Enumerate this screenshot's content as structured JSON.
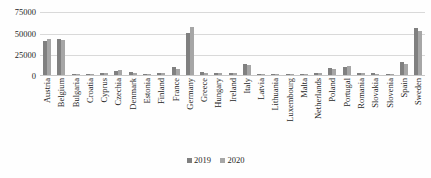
{
  "chart_data": {
    "type": "bar",
    "title": "",
    "subtitle": "",
    "xlabel": "",
    "ylabel": "",
    "ylim": [
      0,
      80000
    ],
    "yticks": [
      0,
      25000,
      50000,
      75000
    ],
    "ytick_labels": [
      "0",
      "25000",
      "50000",
      "75000"
    ],
    "grid": true,
    "legend_position": "bottom-center",
    "categories": [
      "Austria",
      "Belgium",
      "Bulgaria",
      "Croatia",
      "Cyprus",
      "Czechia",
      "Denmark",
      "Estonia",
      "Finland",
      "France",
      "Germany",
      "Greece",
      "Hungary",
      "Ireland",
      "Italy",
      "Latvia",
      "Lithuania",
      "Luxembourg",
      "Malta",
      "Netherlands",
      "Poland",
      "Portugal",
      "Romania",
      "Slovakia",
      "Slovenia",
      "Spain",
      "Sweden"
    ],
    "series": [
      {
        "name": "2019",
        "color": "#808080",
        "values": [
          40000,
          42000,
          1200,
          1500,
          2500,
          4500,
          3000,
          1000,
          2000,
          9000,
          50000,
          3000,
          2000,
          2500,
          13000,
          900,
          1100,
          700,
          500,
          2200,
          8000,
          9500,
          2500,
          1800,
          1200,
          15000,
          55000
        ]
      },
      {
        "name": "2020",
        "color": "#A6A6A6",
        "values": [
          42000,
          41000,
          1000,
          1300,
          2200,
          5500,
          2800,
          900,
          1800,
          7500,
          57000,
          2500,
          1800,
          2200,
          12000,
          800,
          1000,
          600,
          400,
          2000,
          7000,
          10500,
          2200,
          1500,
          1000,
          13000,
          52000
        ]
      }
    ]
  },
  "legend": {
    "items": [
      {
        "label": "2019",
        "color": "#808080"
      },
      {
        "label": "2020",
        "color": "#A6A6A6"
      }
    ]
  }
}
